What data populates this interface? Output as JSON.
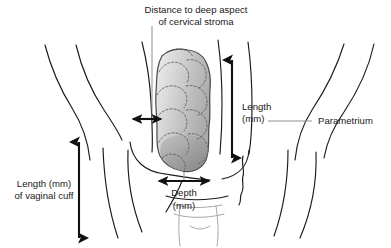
{
  "figure": {
    "background_color": "#ffffff",
    "width": 391,
    "height": 248
  },
  "labels": {
    "distance_line1": "Distance to deep aspect",
    "distance_line2": "of cervical stroma",
    "length_line1": "Length",
    "length_line2": "(mm)",
    "parametrium": "Parametrium",
    "vaginal_cuff_line1": "Length (mm)",
    "vaginal_cuff_line2": "of vaginal cuff",
    "depth_line1": "Depth",
    "depth_line2": "(mm)"
  },
  "measurements": [
    {
      "id": "distance-to-deep-aspect",
      "label": "Distance to deep aspect of cervical stroma",
      "orientation": "horizontal",
      "arrowheads": "both",
      "unit": "mm"
    },
    {
      "id": "tumor-length",
      "label": "Length (mm)",
      "orientation": "vertical",
      "arrowheads": "both",
      "unit": "mm"
    },
    {
      "id": "vaginal-cuff-length",
      "label": "Length (mm) of vaginal cuff",
      "orientation": "vertical",
      "arrowheads": "both",
      "unit": "mm"
    },
    {
      "id": "tumor-depth",
      "label": "Depth (mm)",
      "orientation": "horizontal",
      "arrowheads": "both",
      "unit": "mm"
    }
  ],
  "annotations": [
    {
      "id": "parametrium",
      "label": "Parametrium",
      "type": "leader-callout"
    }
  ],
  "colors": {
    "outline": "#1a1a1a",
    "text": "#1a1a1a",
    "arrow": "#111111",
    "leader": "#8f8f8f",
    "canal": "#a8a8a8",
    "tumor_light": "#e3e3e3",
    "tumor_mid": "#c3c3c3",
    "tumor_dark": "#8c8c8c",
    "tumor_stroke": "#4a4a4a",
    "lobule_stroke": "#5d5d5d"
  },
  "structures": [
    {
      "id": "tumor-mass",
      "name": "Lobulated cervical tumor mass"
    },
    {
      "id": "uterine-cervix",
      "name": "Cervix and endocervical canal"
    },
    {
      "id": "vaginal-wall-left",
      "name": "Left vaginal wall"
    },
    {
      "id": "vaginal-wall-right",
      "name": "Right vaginal wall"
    },
    {
      "id": "parametrial-tissue",
      "name": "Parametrium"
    }
  ]
}
